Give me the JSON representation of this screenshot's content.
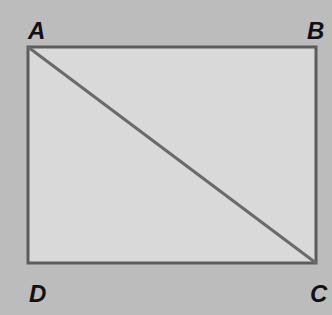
{
  "diagram": {
    "type": "rectangle-with-diagonal",
    "vertices": {
      "A": {
        "label": "A",
        "x": 28,
        "y": 47
      },
      "B": {
        "label": "B",
        "x": 316,
        "y": 47
      },
      "C": {
        "label": "C",
        "x": 316,
        "y": 263
      },
      "D": {
        "label": "D",
        "x": 28,
        "y": 263
      }
    },
    "diagonal": [
      "A",
      "C"
    ],
    "colors": {
      "background": "#bcbcbc",
      "fill": "#d9d9d9",
      "stroke": "#5c5c5c",
      "label": "#111111"
    }
  }
}
